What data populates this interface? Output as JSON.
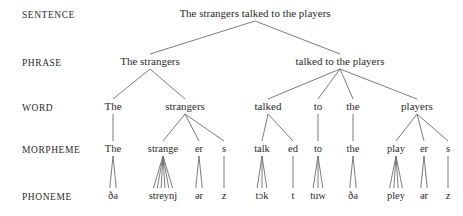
{
  "figure": {
    "background_color": "#ffffff",
    "text_color": "#2b2b2b",
    "line_color": "#6d6d6d",
    "sentence_text": "The strangers talked to the players"
  },
  "levels": [
    {
      "id": "sentence",
      "label": "SENTENCE",
      "x": 22,
      "y": 17
    },
    {
      "id": "phrase",
      "label": "PHRASE",
      "x": 22,
      "y": 65
    },
    {
      "id": "word",
      "label": "WORD",
      "x": 22,
      "y": 110
    },
    {
      "id": "morpheme",
      "label": "MORPHEME",
      "x": 22,
      "y": 152
    },
    {
      "id": "phoneme",
      "label": "PHONEME",
      "x": 22,
      "y": 199
    }
  ],
  "rows": {
    "sentence": {
      "y": 17,
      "nodes": [
        {
          "id": "s1",
          "text": "The strangers talked to the players",
          "x": 255
        }
      ]
    },
    "phrase": {
      "y": 65,
      "nodes": [
        {
          "id": "p1",
          "text": "The strangers",
          "x": 150,
          "parent": "s1"
        },
        {
          "id": "p2",
          "text": "talked to the players",
          "x": 340,
          "parent": "s1"
        }
      ]
    },
    "word": {
      "y": 110,
      "nodes": [
        {
          "id": "w1",
          "text": "The",
          "x": 113,
          "parent": "p1"
        },
        {
          "id": "w2",
          "text": "strangers",
          "x": 185,
          "parent": "p1"
        },
        {
          "id": "w3",
          "text": "talked",
          "x": 268,
          "parent": "p2"
        },
        {
          "id": "w4",
          "text": "to",
          "x": 318,
          "parent": "p2"
        },
        {
          "id": "w5",
          "text": "the",
          "x": 353,
          "parent": "p2"
        },
        {
          "id": "w6",
          "text": "players",
          "x": 417,
          "parent": "p2"
        }
      ]
    },
    "morpheme": {
      "y": 152,
      "nodes": [
        {
          "id": "m1",
          "text": "The",
          "x": 113,
          "parent": "w1"
        },
        {
          "id": "m2",
          "text": "strange",
          "x": 163,
          "parent": "w2"
        },
        {
          "id": "m3",
          "text": "er",
          "x": 199,
          "parent": "w2"
        },
        {
          "id": "m4",
          "text": "s",
          "x": 224,
          "parent": "w2"
        },
        {
          "id": "m5",
          "text": "talk",
          "x": 262,
          "parent": "w3"
        },
        {
          "id": "m6",
          "text": "ed",
          "x": 293,
          "parent": "w3"
        },
        {
          "id": "m7",
          "text": "to",
          "x": 318,
          "parent": "w4"
        },
        {
          "id": "m8",
          "text": "the",
          "x": 353,
          "parent": "w5"
        },
        {
          "id": "m9",
          "text": "play",
          "x": 396,
          "parent": "w6"
        },
        {
          "id": "m10",
          "text": "er",
          "x": 424,
          "parent": "w6"
        },
        {
          "id": "m11",
          "text": "s",
          "x": 448,
          "parent": "w6"
        }
      ]
    },
    "phoneme": {
      "y": 199,
      "nodes": [
        {
          "id": "f1",
          "text": "ðə",
          "x": 113,
          "parent": "m1",
          "strands": 2
        },
        {
          "id": "f2",
          "text": "streynj",
          "x": 163,
          "parent": "m2",
          "strands": 6
        },
        {
          "id": "f3",
          "text": "ər",
          "x": 199,
          "parent": "m3",
          "strands": 2
        },
        {
          "id": "f4",
          "text": "z",
          "x": 224,
          "parent": "m4",
          "strands": 1
        },
        {
          "id": "f5",
          "text": "tɔk",
          "x": 262,
          "parent": "m5",
          "strands": 3
        },
        {
          "id": "f6",
          "text": "t",
          "x": 293,
          "parent": "m6",
          "strands": 1
        },
        {
          "id": "f7",
          "text": "tuw",
          "x": 318,
          "parent": "m7",
          "strands": 3
        },
        {
          "id": "f8",
          "text": "ðə",
          "x": 353,
          "parent": "m8",
          "strands": 2
        },
        {
          "id": "f9",
          "text": "pley",
          "x": 396,
          "parent": "m9",
          "strands": 4
        },
        {
          "id": "f10",
          "text": "ər",
          "x": 424,
          "parent": "m10",
          "strands": 2
        },
        {
          "id": "f11",
          "text": "z",
          "x": 448,
          "parent": "m11",
          "strands": 1
        }
      ]
    }
  }
}
